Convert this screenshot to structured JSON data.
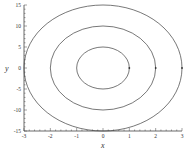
{
  "chart_data": {
    "type": "line",
    "title": "",
    "xlabel": "x",
    "ylabel": "y",
    "xlim": [
      -3,
      3
    ],
    "ylim": [
      -15,
      15
    ],
    "x_ticks": [
      -3,
      -2,
      -1,
      0,
      1,
      2,
      3
    ],
    "y_ticks": [
      -15,
      -10,
      -5,
      0,
      5,
      10,
      15
    ],
    "grid": false,
    "legend": null,
    "series": [
      {
        "name": "ellipse-inner",
        "shape": "ellipse",
        "center": [
          0,
          0
        ],
        "semi_x": 1,
        "semi_y": 5,
        "marker_point": [
          1,
          0
        ]
      },
      {
        "name": "ellipse-middle",
        "shape": "ellipse",
        "center": [
          0,
          0
        ],
        "semi_x": 2,
        "semi_y": 10,
        "marker_point": [
          2,
          0
        ]
      },
      {
        "name": "ellipse-outer",
        "shape": "ellipse",
        "center": [
          0,
          0
        ],
        "semi_x": 3,
        "semi_y": 15,
        "marker_point": [
          3,
          0
        ]
      }
    ],
    "line_color": "#555555"
  },
  "labels": {
    "x_axis": "x",
    "y_axis": "y",
    "x_ticks": [
      "-3",
      "-2",
      "-1",
      "0",
      "1",
      "2",
      "3"
    ],
    "y_ticks": [
      "15",
      "10",
      "5",
      "0",
      "-5",
      "-10",
      "-15"
    ]
  }
}
